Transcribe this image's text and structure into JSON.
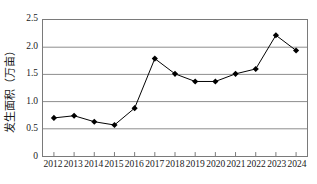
{
  "chart_data": {
    "type": "line",
    "title": "",
    "xlabel": "",
    "ylabel": "发生面积（万亩）",
    "categories": [
      "2012",
      "2013",
      "2014",
      "2015",
      "2016",
      "2017",
      "2018",
      "2019",
      "2020",
      "2021",
      "2022",
      "2023",
      "2024"
    ],
    "values": [
      0.7,
      0.74,
      0.63,
      0.57,
      0.88,
      1.79,
      1.51,
      1.37,
      1.37,
      1.51,
      1.6,
      2.22,
      1.94
    ],
    "series": [
      {
        "name": "发生面积（万亩）",
        "values": [
          0.7,
          0.74,
          0.63,
          0.57,
          0.88,
          1.79,
          1.51,
          1.37,
          1.37,
          1.51,
          1.6,
          2.22,
          1.94
        ]
      }
    ],
    "ylim": [
      0,
      2.5
    ],
    "y_ticks": [
      "0",
      "0.5",
      "1.0",
      "1.5",
      "2.0",
      "2.5"
    ],
    "y_tick_values": [
      0,
      0.5,
      1.0,
      1.5,
      2.0,
      2.5
    ],
    "grid": "horizontal",
    "legend": "none",
    "marker": "diamond",
    "line_color": "#000000",
    "marker_color": "#000000",
    "grid_color": "#8c8c8c",
    "axis_color": "#7a7a7a",
    "background_color": "#ffffff"
  }
}
